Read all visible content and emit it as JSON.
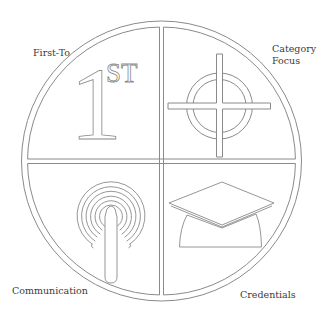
{
  "diagram": {
    "type": "quadrant-circle",
    "stroke_color": "#8a8a8a",
    "background": "#ffffff",
    "quadrants": [
      {
        "position": "top-left",
        "label": "First-To",
        "icon": "first-place-1st-icon",
        "icon_text_main": "1",
        "icon_text_sup": "ST"
      },
      {
        "position": "top-right",
        "label_line1": "Category",
        "label_line2": "Focus",
        "icon": "crosshair-target-icon"
      },
      {
        "position": "bottom-left",
        "label": "Communication",
        "icon": "broadcast-antenna-icon"
      },
      {
        "position": "bottom-right",
        "label": "Credentials",
        "icon": "graduation-cap-icon"
      }
    ]
  }
}
